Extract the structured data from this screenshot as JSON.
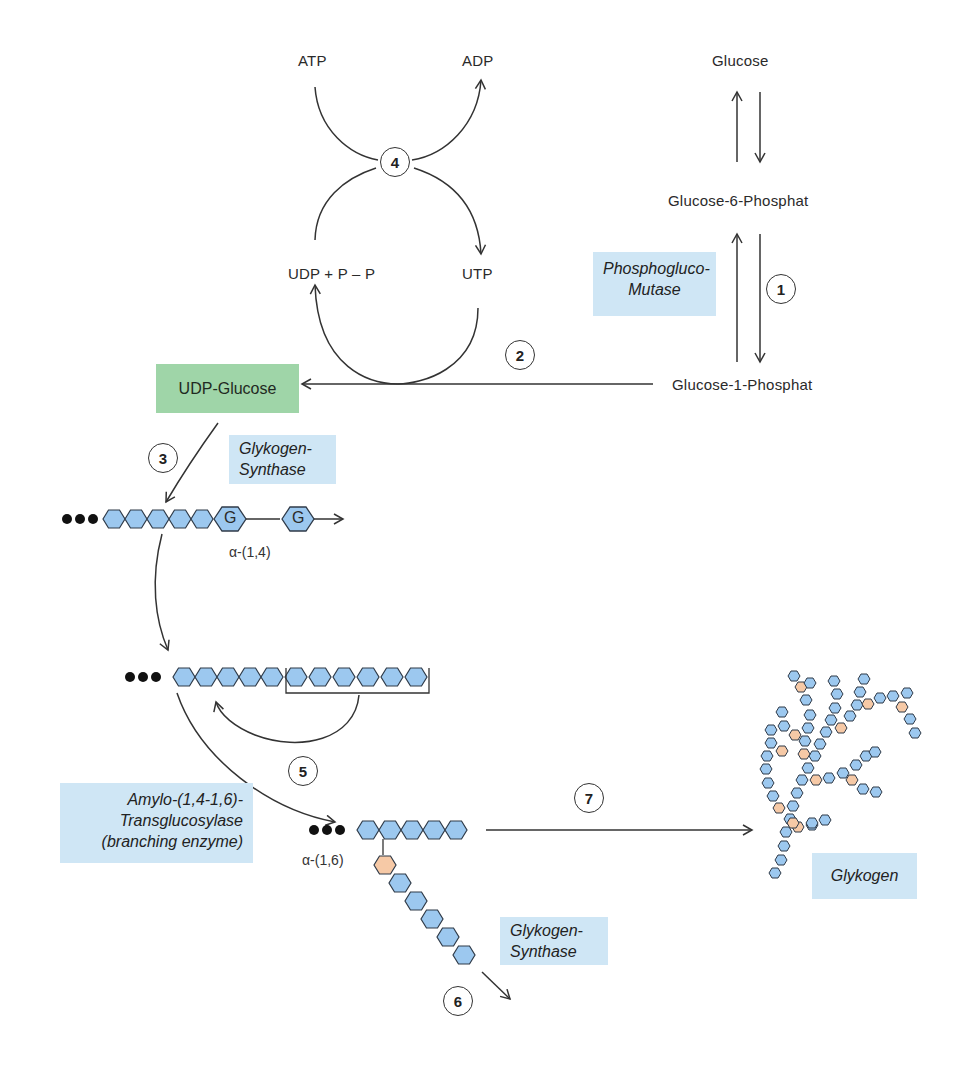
{
  "metabolites": {
    "glucose": "Glucose",
    "g6p": "Glucose-6-Phosphat",
    "g1p": "Glucose-1-Phosphat",
    "atp": "ATP",
    "adp": "ADP",
    "utp": "UTP",
    "udp_ppi": "UDP + P – P",
    "udp_glucose": "UDP-Glucose"
  },
  "enzymes": {
    "phosphoglucomutase": [
      "Phosphogluco-",
      "Mutase"
    ],
    "glycogen_synthase_1": [
      "Glykogen-",
      "Synthase"
    ],
    "branching_enzyme": [
      "Amylo-(1,4-1,6)-",
      "Transglucosylase",
      "(branching enzyme)"
    ],
    "glycogen_synthase_2": [
      "Glykogen-",
      "Synthase"
    ],
    "glycogen": "Glykogen"
  },
  "bonds": {
    "alpha14": "α-(1,4)",
    "alpha16": "α-(1,6)"
  },
  "glucose_unit_label": "G",
  "steps": [
    "1",
    "2",
    "3",
    "4",
    "5",
    "6",
    "7"
  ],
  "colors": {
    "glucose_unit": "#9cc8ef",
    "branch_unit": "#f6c9a6",
    "enzyme_box": "#cfe6f5",
    "product_box": "#9fd5a8",
    "stroke": "#333333"
  }
}
